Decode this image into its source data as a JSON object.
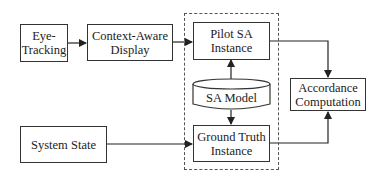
{
  "diagram": {
    "nodes": {
      "eye_tracking": {
        "line1": "Eye-",
        "line2": "Tracking"
      },
      "context_display": {
        "line1": "Context-Aware",
        "line2": "Display"
      },
      "pilot_sa": {
        "line1": "Pilot SA",
        "line2": "Instance"
      },
      "sa_model": {
        "label": "SA Model"
      },
      "ground_truth": {
        "line1": "Ground Truth",
        "line2": "Instance"
      },
      "accordance": {
        "line1": "Accordance",
        "line2": "Computation"
      },
      "system_state": {
        "label": "System State"
      }
    },
    "edges": [
      {
        "from": "eye_tracking",
        "to": "context_display"
      },
      {
        "from": "context_display",
        "to": "pilot_sa"
      },
      {
        "from": "sa_model",
        "to": "pilot_sa"
      },
      {
        "from": "sa_model",
        "to": "ground_truth"
      },
      {
        "from": "system_state",
        "to": "ground_truth"
      },
      {
        "from": "pilot_sa",
        "to": "accordance"
      },
      {
        "from": "ground_truth",
        "to": "accordance"
      }
    ]
  }
}
